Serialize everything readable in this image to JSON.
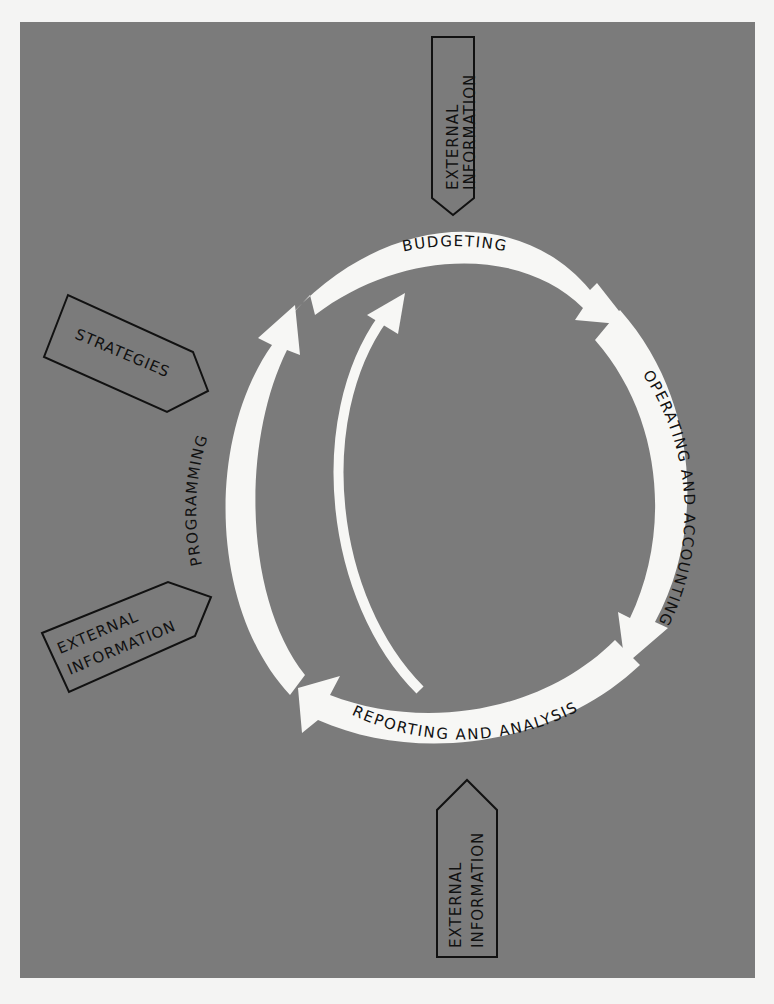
{
  "diagram": {
    "type": "cycle",
    "background_color": "#7b7b7b",
    "page_color": "#f4f4f3",
    "arrow_color": "#f7f7f5",
    "cycle_stages": [
      {
        "id": "budgeting",
        "label": "BUDGETING"
      },
      {
        "id": "operating",
        "label": "OPERATING AND ACCOUNTING"
      },
      {
        "id": "reporting",
        "label": "REPORTING AND ANALYSIS"
      },
      {
        "id": "programming",
        "label": "PROGRAMMING"
      }
    ],
    "feedback_arrow": {
      "from": "reporting",
      "to": "budgeting"
    },
    "inputs": [
      {
        "id": "ext-top",
        "line1": "EXTERNAL",
        "line2": "INFORMATION",
        "target": "budgeting"
      },
      {
        "id": "strategies",
        "label": "STRATEGIES",
        "target": "programming"
      },
      {
        "id": "ext-left",
        "line1": "EXTERNAL",
        "line2": "INFORMATION",
        "target": "programming"
      },
      {
        "id": "ext-bottom",
        "line1": "EXTERNAL",
        "line2": "INFORMATION",
        "target": "reporting"
      }
    ]
  }
}
